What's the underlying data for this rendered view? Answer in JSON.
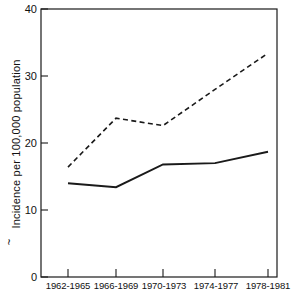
{
  "chart_data": {
    "type": "line",
    "title": "",
    "xlabel": "",
    "ylabel": "Incidence per 100,000 population",
    "ylabel_prefix": "~",
    "categories": [
      "1962-1965",
      "1966-1969",
      "1970-1973",
      "1974-1977",
      "1978-1981"
    ],
    "ylim": [
      0,
      40
    ],
    "yticks": [
      0,
      10,
      20,
      30,
      40
    ],
    "ytick_labels": [
      "0",
      "10",
      "20",
      "30",
      "40"
    ],
    "grid": false,
    "legend": "none",
    "series": [
      {
        "name": "dashed-series",
        "style": "dashed",
        "color": "#1a1a1a",
        "values": [
          16.4,
          23.7,
          22.6,
          28.0,
          33.4
        ]
      },
      {
        "name": "solid-series",
        "style": "solid",
        "color": "#1a1a1a",
        "values": [
          14.0,
          13.4,
          16.8,
          17.0,
          18.7
        ]
      }
    ]
  },
  "axis": {
    "y_tick_0": "0",
    "y_tick_10": "10",
    "y_tick_20": "20",
    "y_tick_30": "30",
    "y_tick_40": "40",
    "x_tick_0": "1962-1965",
    "x_tick_1": "1966-1969",
    "x_tick_2": "1970-1973",
    "x_tick_3": "1974-1977",
    "x_tick_4": "1978-1981",
    "y_axis_title": "Incidence per 100,000 population",
    "y_axis_marker": "~"
  }
}
